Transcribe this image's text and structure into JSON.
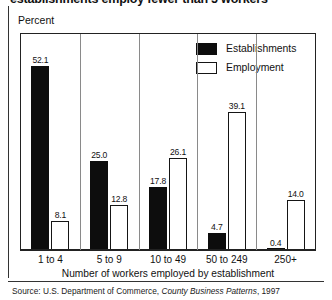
{
  "chart_data": {
    "type": "bar",
    "title": "establishments employ fewer than 5 workers",
    "ylabel": "Percent",
    "xlabel": "Number of workers employed by establishment",
    "categories": [
      "1 to 4",
      "5 to 9",
      "10 to 49",
      "50 to 249",
      "250+"
    ],
    "series": [
      {
        "name": "Establishments",
        "color": "#0d0d0d",
        "fill": "solid",
        "values": [
          52.1,
          25.0,
          17.8,
          4.7,
          0.4
        ]
      },
      {
        "name": "Employment",
        "color": "#ffffff",
        "fill": "outline",
        "values": [
          8.1,
          12.8,
          26.1,
          39.1,
          14.0
        ]
      }
    ],
    "ylim": [
      0,
      61
    ],
    "grid": false,
    "legend_position": "top-right",
    "value_labels": true
  },
  "source": {
    "prefix": "Source: U.S. Department of Commerce, ",
    "publication": "County Business Patterns",
    "suffix": ", 1997"
  }
}
